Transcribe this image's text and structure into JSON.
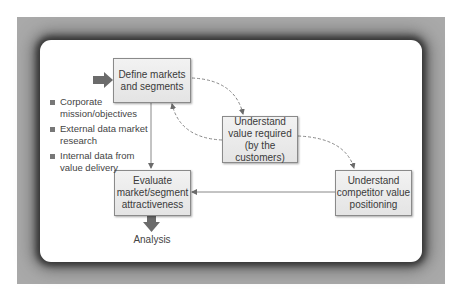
{
  "diagram": {
    "boxes": {
      "define": "Define markets and segments",
      "value": "Understand value required (by the customers)",
      "competitor": "Understand competitor value positioning",
      "evaluate": "Evaluate market/segment attractiveness"
    },
    "box_lines": {
      "define": [
        "Define markets",
        "and segments"
      ],
      "value": [
        "Understand",
        "value required",
        "(by the customers)"
      ],
      "competitor": [
        "Understand",
        "competitor value",
        "positioning"
      ],
      "evaluate": [
        "Evaluate",
        "market/segment",
        "attractiveness"
      ]
    },
    "inputs": [
      {
        "label": "Corporate mission/objectives"
      },
      {
        "label": "External data market research"
      },
      {
        "label": "Internal data from value delivery"
      }
    ],
    "output_label": "Analysis",
    "colors": {
      "frame": "#a9a9a9",
      "box_fill": "#ececec",
      "box_border": "#8a8a8a",
      "arrow": "#6b6b6b"
    }
  }
}
